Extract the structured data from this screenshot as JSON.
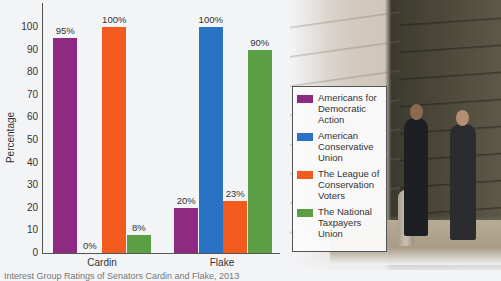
{
  "chart_data": {
    "type": "bar",
    "title": "",
    "xlabel": "",
    "ylabel": "Percentage",
    "ylim": [
      0,
      100
    ],
    "yticks": [
      0,
      10,
      20,
      30,
      40,
      50,
      60,
      70,
      80,
      90,
      100
    ],
    "grid": false,
    "legend_position": "right",
    "categories": [
      "Cardin",
      "Flake"
    ],
    "series": [
      {
        "name": "Americans for Democratic Action",
        "color": "#8e2a82",
        "values": [
          95,
          20
        ],
        "labels": [
          "95%",
          "20%"
        ]
      },
      {
        "name": "American Conservative Union",
        "color": "#2a72c4",
        "values": [
          0,
          100
        ],
        "labels": [
          "0%",
          "100%"
        ]
      },
      {
        "name": "The League of Conservation Voters",
        "color": "#f25a1e",
        "values": [
          100,
          23
        ],
        "labels": [
          "100%",
          "23%"
        ]
      },
      {
        "name": "The National Taxpayers Union",
        "color": "#5b9e46",
        "values": [
          8,
          90
        ],
        "labels": [
          "8%",
          "90%"
        ]
      }
    ]
  },
  "axis": {
    "ylabel": "Percentage",
    "ticks": [
      "0",
      "10",
      "20",
      "30",
      "40",
      "50",
      "60",
      "70",
      "80",
      "90",
      "100"
    ],
    "categories": [
      "Cardin",
      "Flake"
    ]
  },
  "legend": {
    "items": [
      {
        "label": "Americans for Democratic Action",
        "color": "#8e2a82"
      },
      {
        "label": "American Conservative Union",
        "color": "#2a72c4"
      },
      {
        "label": "The League of Conservation Voters",
        "color": "#f25a1e"
      },
      {
        "label": "The National Taxpayers Union",
        "color": "#5b9e46"
      }
    ]
  },
  "caption": "Interest Group Ratings of Senators Cardin and Flake, 2013"
}
